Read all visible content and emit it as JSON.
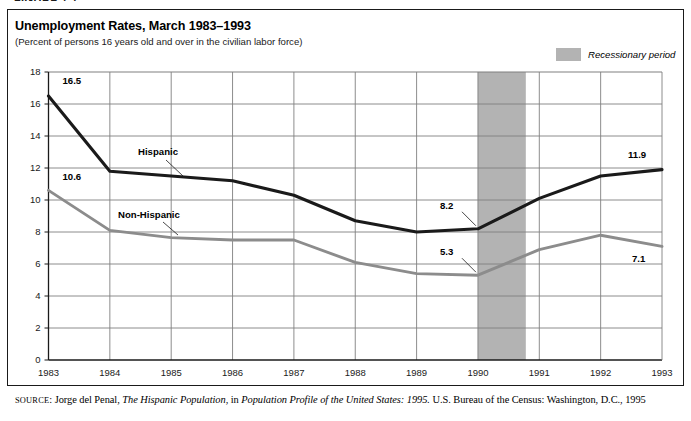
{
  "page": {
    "clipped_heading": "FIGURE 7.1"
  },
  "chart_header": {
    "title": "Unemployment Rates, March 1983–1993",
    "subtitle": "(Percent of persons 16 years old and over in the civilian labor force)"
  },
  "legend": {
    "recession_label": "Recessionary period",
    "recession_color": "#b3b3b3"
  },
  "source": {
    "label": "SOURCE",
    "sep": ": ",
    "author": "Jorge del Penal, ",
    "work_italic": "The Hispanic Population",
    "mid": ", in ",
    "publication_italic": "Population Profile of the United States: 1995.",
    "tail": " U.S. Bureau of the Census: Washington, D.C., 1995"
  },
  "chart_data": {
    "type": "line",
    "title": "Unemployment Rates, March 1983–1993",
    "subtitle": "(Percent of persons 16 years old and over in the civilian labor force)",
    "xlabel": "",
    "ylabel": "",
    "x": [
      1983,
      1984,
      1985,
      1986,
      1987,
      1988,
      1989,
      1990,
      1991,
      1992,
      1993
    ],
    "categories": [
      "1983",
      "1984",
      "1985",
      "1986",
      "1987",
      "1988",
      "1989",
      "1990",
      "1991",
      "1992",
      "1993"
    ],
    "ylim": [
      0,
      18
    ],
    "yticks": [
      0,
      2,
      4,
      6,
      8,
      10,
      12,
      14,
      16,
      18
    ],
    "ytick_labels": [
      "0",
      "2",
      "4",
      "6",
      "8",
      "10",
      "12",
      "14",
      "16",
      "18"
    ],
    "grid": true,
    "legend_position": "inline-annotations",
    "series": [
      {
        "name": "Hispanic",
        "color": "#1a1a1a",
        "values": [
          16.5,
          11.8,
          11.5,
          11.2,
          10.3,
          8.7,
          8.0,
          8.2,
          10.1,
          11.5,
          11.9
        ]
      },
      {
        "name": "Non-Hispanic",
        "color": "#8c8c8c",
        "values": [
          10.6,
          8.1,
          7.65,
          7.5,
          7.5,
          6.1,
          5.4,
          5.3,
          6.9,
          7.8,
          7.1
        ]
      }
    ],
    "point_labels": [
      {
        "series": "Hispanic",
        "x": 1983,
        "value": 16.5,
        "text": "16.5"
      },
      {
        "series": "Hispanic",
        "x": 1990,
        "value": 8.2,
        "text": "8.2"
      },
      {
        "series": "Hispanic",
        "x": 1993,
        "value": 11.9,
        "text": "11.9"
      },
      {
        "series": "Non-Hispanic",
        "x": 1983,
        "value": 10.6,
        "text": "10.6"
      },
      {
        "series": "Non-Hispanic",
        "x": 1990,
        "value": 5.3,
        "text": "5.3"
      },
      {
        "series": "Non-Hispanic",
        "x": 1993,
        "value": 7.1,
        "text": "7.1"
      }
    ],
    "annotations": [
      {
        "type": "band",
        "label": "Recessionary period",
        "x_start": 1990.0,
        "x_end": 1990.78,
        "color": "#b3b3b3"
      },
      {
        "type": "series-callout",
        "label": "Hispanic"
      },
      {
        "type": "series-callout",
        "label": "Non-Hispanic"
      }
    ]
  }
}
